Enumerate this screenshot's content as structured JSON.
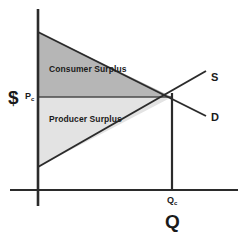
{
  "chart_data": {
    "type": "line",
    "xlabel": "Q",
    "ylabel": "$",
    "grid": false,
    "legend_position": "inline-right",
    "axes": {
      "y_axis_label": "$",
      "x_axis_label": "Q",
      "price_tick_label": "Pc",
      "price_tick_sub": "c",
      "price_tick_main": "P",
      "quantity_tick_label": "Qc",
      "quantity_tick_main": "Q",
      "quantity_tick_sub": "c"
    },
    "series": [
      {
        "name": "D",
        "label": "D",
        "role": "demand",
        "slope": "downward",
        "points": [
          [
            38,
            32
          ],
          [
            205,
            115
          ]
        ]
      },
      {
        "name": "S",
        "label": "S",
        "role": "supply",
        "slope": "upward",
        "points": [
          [
            38,
            167
          ],
          [
            205,
            72
          ]
        ]
      }
    ],
    "equilibrium": {
      "x": 172,
      "y": 97,
      "price_label": "Pc",
      "quantity_label": "Qc"
    },
    "regions": [
      {
        "name": "consumer-surplus",
        "label": "Consumer Surplus",
        "fill": "#b6b6b6",
        "vertices": [
          [
            38,
            32
          ],
          [
            172,
            97
          ],
          [
            38,
            97
          ]
        ]
      },
      {
        "name": "producer-surplus",
        "label": "Producer Surplus",
        "fill": "#e3e3e3",
        "vertices": [
          [
            38,
            97
          ],
          [
            172,
            97
          ],
          [
            38,
            167
          ]
        ]
      }
    ],
    "colors": {
      "consumer_surplus_fill": "#b6b6b6",
      "producer_surplus_fill": "#e3e3e3",
      "line": "#2b2b2b",
      "background": "#ffffff"
    }
  },
  "labels": {
    "consumer_surplus": "Consumer Surplus",
    "producer_surplus": "Producer Surplus",
    "supply": "S",
    "demand": "D",
    "dollar": "$",
    "price_main": "P",
    "price_sub": "c",
    "quantity_small_main": "Q",
    "quantity_small_sub": "c",
    "quantity_big": "Q"
  }
}
